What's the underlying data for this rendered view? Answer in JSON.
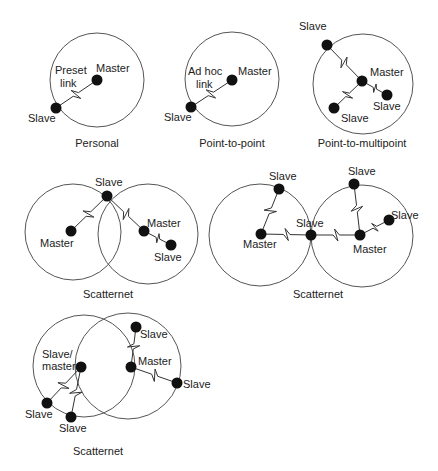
{
  "figure": {
    "colors": {
      "background": "#ffffff",
      "ring": "#555555",
      "node": "#111111",
      "text": "#222222"
    },
    "diagrams": [
      {
        "caption": "Personal",
        "caption_pos": [
          97,
          147
        ],
        "circles": [
          {
            "cx": 97,
            "cy": 80,
            "r": 47
          }
        ],
        "nodes": [
          {
            "role": "master",
            "x": 97,
            "y": 80,
            "label": "Master",
            "lx": 96,
            "ly": 72
          },
          {
            "role": "slave",
            "x": 56,
            "y": 108,
            "label": "Slave",
            "lx": 28,
            "ly": 122
          }
        ],
        "links": [
          {
            "from": [
              97,
              80
            ],
            "to": [
              56,
              108
            ]
          }
        ],
        "notes": [
          {
            "text": "Preset",
            "x": 55,
            "y": 74
          },
          {
            "text": "link",
            "x": 60,
            "y": 87
          }
        ]
      },
      {
        "caption": "Point-to-point",
        "caption_pos": [
          232,
          147
        ],
        "circles": [
          {
            "cx": 232,
            "cy": 79,
            "r": 47
          }
        ],
        "nodes": [
          {
            "role": "master",
            "x": 232,
            "y": 80,
            "label": "Master",
            "lx": 238,
            "ly": 75
          },
          {
            "role": "slave",
            "x": 191,
            "y": 107,
            "label": "Slave",
            "lx": 164,
            "ly": 121
          }
        ],
        "links": [
          {
            "from": [
              232,
              80
            ],
            "to": [
              191,
              107
            ]
          }
        ],
        "notes": [
          {
            "text": "Ad hoc",
            "x": 188,
            "y": 75
          },
          {
            "text": "link",
            "x": 196,
            "y": 88
          }
        ]
      },
      {
        "caption": "Point-to-multipoint",
        "caption_pos": [
          362,
          147
        ],
        "circles": [
          {
            "cx": 363,
            "cy": 84,
            "r": 50
          }
        ],
        "nodes": [
          {
            "role": "master",
            "x": 362,
            "y": 81,
            "label": "Master",
            "lx": 370,
            "ly": 76
          },
          {
            "role": "slave",
            "x": 327,
            "y": 45,
            "label": "Slave",
            "lx": 299,
            "ly": 30
          },
          {
            "role": "slave",
            "x": 387,
            "y": 95,
            "label": "Slave",
            "lx": 373,
            "ly": 110
          },
          {
            "role": "slave",
            "x": 334,
            "y": 108,
            "label": "Slave",
            "lx": 341,
            "ly": 122
          }
        ],
        "links": [
          {
            "from": [
              362,
              81
            ],
            "to": [
              327,
              45
            ]
          },
          {
            "from": [
              362,
              81
            ],
            "to": [
              387,
              95
            ]
          },
          {
            "from": [
              362,
              81
            ],
            "to": [
              334,
              108
            ]
          }
        ],
        "notes": []
      },
      {
        "caption": "Scatternet",
        "caption_pos": [
          108,
          298
        ],
        "circles": [
          {
            "cx": 73,
            "cy": 232,
            "r": 48
          },
          {
            "cx": 148,
            "cy": 234,
            "r": 50
          }
        ],
        "nodes": [
          {
            "role": "slave",
            "x": 107,
            "y": 196,
            "label": "Slave",
            "lx": 95,
            "ly": 186
          },
          {
            "role": "master",
            "x": 71,
            "y": 231,
            "label": "Master",
            "lx": 40,
            "ly": 247
          },
          {
            "role": "master",
            "x": 144,
            "y": 231,
            "label": "Master",
            "lx": 147,
            "ly": 227
          },
          {
            "role": "slave",
            "x": 171,
            "y": 245,
            "label": "Slave",
            "lx": 154,
            "ly": 261
          }
        ],
        "links": [
          {
            "from": [
              107,
              196
            ],
            "to": [
              71,
              231
            ]
          },
          {
            "from": [
              107,
              196
            ],
            "to": [
              144,
              231
            ]
          },
          {
            "from": [
              144,
              231
            ],
            "to": [
              171,
              245
            ]
          }
        ],
        "notes": []
      },
      {
        "caption": "Scatternet",
        "caption_pos": [
          318,
          298
        ],
        "circles": [
          {
            "cx": 260,
            "cy": 235,
            "r": 51
          },
          {
            "cx": 362,
            "cy": 236,
            "r": 51
          }
        ],
        "nodes": [
          {
            "role": "slave",
            "x": 279,
            "y": 189,
            "label": "Slave",
            "lx": 269,
            "ly": 180
          },
          {
            "role": "master",
            "x": 261,
            "y": 234,
            "label": "Master",
            "lx": 243,
            "ly": 248
          },
          {
            "role": "slave",
            "x": 311,
            "y": 235,
            "label": "Slave",
            "lx": 296,
            "ly": 227
          },
          {
            "role": "master",
            "x": 360,
            "y": 235,
            "label": "Master",
            "lx": 353,
            "ly": 253
          },
          {
            "role": "slave",
            "x": 354,
            "y": 184,
            "label": "Slave",
            "lx": 348,
            "ly": 175
          },
          {
            "role": "slave",
            "x": 389,
            "y": 220,
            "label": "Slave",
            "lx": 391,
            "ly": 219
          }
        ],
        "links": [
          {
            "from": [
              261,
              234
            ],
            "to": [
              279,
              189
            ]
          },
          {
            "from": [
              261,
              234
            ],
            "to": [
              311,
              235
            ]
          },
          {
            "from": [
              311,
              235
            ],
            "to": [
              360,
              235
            ]
          },
          {
            "from": [
              360,
              235
            ],
            "to": [
              354,
              184
            ]
          },
          {
            "from": [
              360,
              235
            ],
            "to": [
              389,
              220
            ]
          }
        ],
        "notes": []
      },
      {
        "caption": "Scatternet",
        "caption_pos": [
          98,
          455
        ],
        "circles": [
          {
            "cx": 84,
            "cy": 366,
            "r": 51
          },
          {
            "cx": 128,
            "cy": 366,
            "r": 53
          }
        ],
        "nodes": [
          {
            "role": "slave-master",
            "x": 81,
            "y": 367,
            "label": "Slave/",
            "label2": "master",
            "lx": 42,
            "ly": 358
          },
          {
            "role": "slave",
            "x": 47,
            "y": 403,
            "label": "Slave",
            "lx": 25,
            "ly": 418
          },
          {
            "role": "slave",
            "x": 71,
            "y": 417,
            "label": "Slave",
            "lx": 59,
            "ly": 432
          },
          {
            "role": "master",
            "x": 131,
            "y": 367,
            "label": "Master",
            "lx": 138,
            "ly": 365
          },
          {
            "role": "slave",
            "x": 136,
            "y": 327,
            "label": "Slave",
            "lx": 140,
            "ly": 338
          },
          {
            "role": "slave",
            "x": 177,
            "y": 383,
            "label": "Slave",
            "lx": 183,
            "ly": 388
          }
        ],
        "links": [
          {
            "from": [
              81,
              367
            ],
            "to": [
              47,
              403
            ]
          },
          {
            "from": [
              81,
              367
            ],
            "to": [
              71,
              417
            ]
          },
          {
            "from": [
              131,
              367
            ],
            "to": [
              136,
              327
            ]
          },
          {
            "from": [
              131,
              367
            ],
            "to": [
              177,
              383
            ]
          }
        ],
        "notes": []
      }
    ]
  }
}
